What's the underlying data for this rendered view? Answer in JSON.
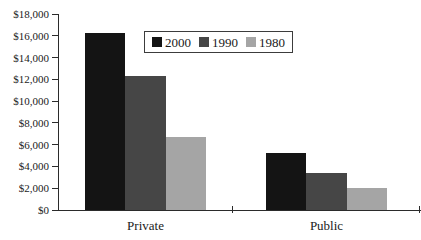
{
  "chart_data": {
    "type": "bar",
    "categories": [
      "Private",
      "Public"
    ],
    "series": [
      {
        "name": "2000",
        "color": "#141414",
        "values": [
          16300,
          5200
        ]
      },
      {
        "name": "1990",
        "color": "#464646",
        "values": [
          12300,
          3400
        ]
      },
      {
        "name": "1980",
        "color": "#a5a5a5",
        "values": [
          6700,
          2000
        ]
      }
    ],
    "ylabel": "",
    "xlabel": "",
    "ylim": [
      0,
      18000
    ],
    "ytick_step": 2000,
    "ytick_labels": [
      "$0",
      "$2,000",
      "$4,000",
      "$6,000",
      "$8,000",
      "$10,000",
      "$12,000",
      "$14,000",
      "$16,000",
      "$18,000"
    ],
    "grid": false,
    "legend_position": "top-center-inside",
    "axis_color": "#2b2b2b",
    "background_color": "#ffffff"
  }
}
